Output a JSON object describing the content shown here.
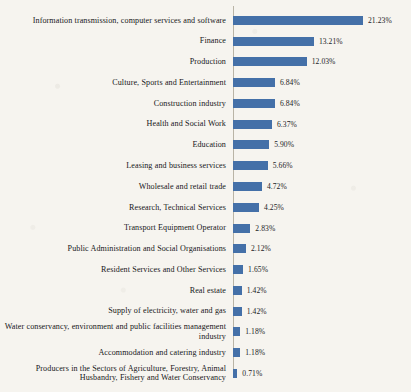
{
  "chart_data": {
    "type": "bar",
    "orientation": "horizontal",
    "title": "",
    "subtitle": "",
    "xlabel": "",
    "ylabel": "",
    "grid": false,
    "legend": "none",
    "axis_line": true,
    "xlim": [
      0,
      21.23
    ],
    "bar_color": "#4470a8",
    "value_suffix": "%",
    "categories": [
      "Information transmission, computer services and software",
      "Finance",
      "Production",
      "Culture, Sports and Entertainment",
      "Construction industry",
      "Health and Social Work",
      "Education",
      "Leasing and business services",
      "Wholesale and retail trade",
      "Research, Technical Services",
      "Transport Equipment Operator",
      "Public Administration and Social Organisations",
      "Resident Services and Other Services",
      "Real estate",
      "Supply of electricity, water and gas",
      "Water conservancy, environment and public facilities management industry",
      "Accommodation and catering industry",
      "Producers in the Sectors of Agriculture, Forestry, Animal Husbandry, Fishery and Water Conservancy"
    ],
    "values": [
      21.23,
      13.21,
      12.03,
      6.84,
      6.84,
      6.37,
      5.9,
      5.66,
      4.72,
      4.25,
      2.83,
      2.12,
      1.65,
      1.42,
      1.42,
      1.18,
      1.18,
      0.71
    ],
    "value_labels": [
      "21.23%",
      "13.21%",
      "12.03%",
      "6.84%",
      "6.84%",
      "6.37%",
      "5.90%",
      "5.66%",
      "4.72%",
      "4.25%",
      "2.83%",
      "2.12%",
      "1.65%",
      "1.42%",
      "1.42%",
      "1.18%",
      "1.18%",
      "0.71%"
    ]
  }
}
